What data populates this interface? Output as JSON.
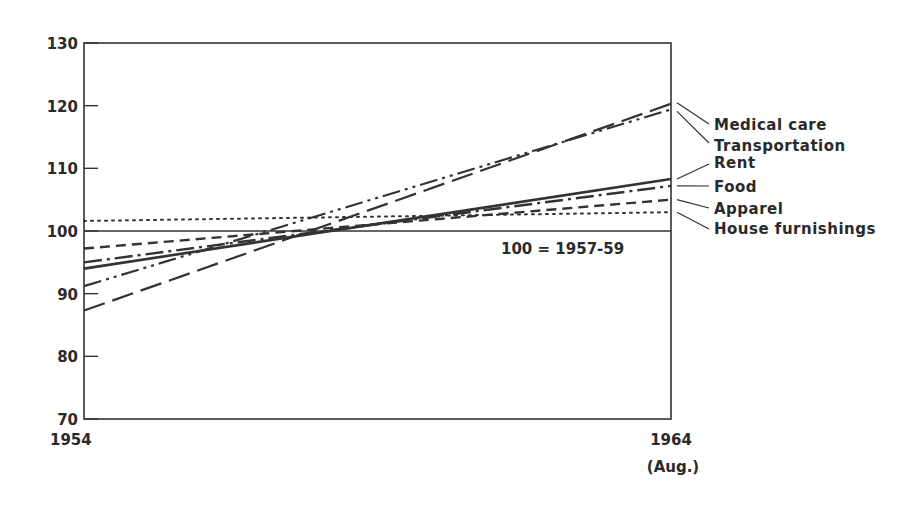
{
  "chart_data": {
    "type": "line",
    "title": "",
    "xlabel": "",
    "ylabel": "",
    "x": [
      "1954",
      "1964 (Aug.)"
    ],
    "x_tick_labels": [
      "1954",
      "1964"
    ],
    "x_tick_sublabel": "(Aug.)",
    "ylim": [
      70,
      130
    ],
    "y_ticks": [
      70,
      80,
      90,
      100,
      110,
      120,
      130
    ],
    "grid": false,
    "reference_line": {
      "value": 100,
      "label": "100 = 1957-59"
    },
    "legend_position": "right, direct labels with leader lines",
    "series": [
      {
        "name": "Medical care",
        "values": [
          87.3,
          120.3
        ],
        "style": "long-dash"
      },
      {
        "name": "Transportation",
        "values": [
          91.2,
          119.4
        ],
        "style": "dash-dot-dot"
      },
      {
        "name": "Rent",
        "values": [
          94.0,
          108.3
        ],
        "style": "solid"
      },
      {
        "name": "Food",
        "values": [
          95.0,
          107.2
        ],
        "style": "dash-dot"
      },
      {
        "name": "Apparel",
        "values": [
          97.2,
          105.0
        ],
        "style": "dashed"
      },
      {
        "name": "House furnishings",
        "values": [
          101.6,
          103.0
        ],
        "style": "dotted"
      }
    ],
    "colors": {
      "line": "#333333",
      "text": "#2a2a2a"
    }
  }
}
